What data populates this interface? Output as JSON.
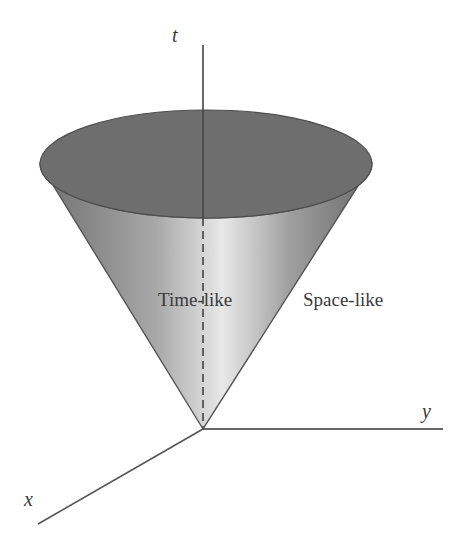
{
  "diagram": {
    "type": "light-cone",
    "axes": {
      "t": "t",
      "x": "x",
      "y": "y"
    },
    "regions": {
      "inside": "Time-like",
      "outside": "Space-like"
    },
    "colors": {
      "cone_top": "#6e6e6e",
      "cone_side_dark": "#777777",
      "cone_side_light": "#e6e6e6",
      "axis": "#555555",
      "text": "#3a3a3a"
    }
  }
}
